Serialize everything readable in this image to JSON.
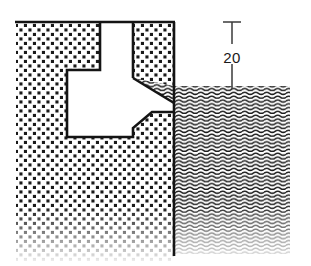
{
  "figure": {
    "type": "engineering-cross-section",
    "canvas": {
      "width": 311,
      "height": 266
    },
    "line_color": "#141414",
    "background_color": "#ffffff",
    "hatch_color": "#1a1a1a"
  },
  "dimension": {
    "label": "20",
    "name": "depth-dimension",
    "value": 20,
    "unit": "",
    "x": 232,
    "top_y": 22,
    "bottom_y": 88,
    "tick_half_width": 9,
    "text_x": 238,
    "text_y": 58
  },
  "regions": {
    "solid": {
      "name": "dotted-solid-region",
      "pattern": "dot-grid",
      "left": 16,
      "right": 174,
      "top": 22,
      "bottom": 258,
      "fade_start": 226
    },
    "liquid": {
      "name": "wavy-hatched-region",
      "pattern": "wavy-lines",
      "left": 174,
      "right": 290,
      "top": 86,
      "bottom": 252,
      "fade_start": 226
    }
  },
  "geometry": {
    "top_edge": {
      "name": "top-edge-line",
      "x1": 16,
      "y1": 22,
      "x2": 174,
      "y2": 22
    },
    "vertical_edge": {
      "name": "right-vertical-edge",
      "x1": 174,
      "y1": 22,
      "x2": 174,
      "y2": 255
    },
    "cavity_outline": {
      "name": "cavity-outline",
      "points": "100,22 100,70 67,70 67,137 133,137 133,128 152,112 174,112 174,103 133,78 133,22"
    },
    "chamfer": {
      "name": "chamfer-edge",
      "x1": 133,
      "y1": 78,
      "x2": 174,
      "y2": 103
    },
    "notch_step": {
      "name": "notch-step-edge",
      "x1": 133,
      "y1": 128,
      "x2": 152,
      "y2": 112
    }
  }
}
